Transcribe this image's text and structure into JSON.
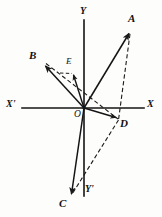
{
  "figure": {
    "type": "vector-diagram",
    "background_color": "#fdfdfc",
    "stroke_color": "#1a1a1a",
    "width": 162,
    "height": 217,
    "axes": {
      "x_positive_label": "X",
      "x_negative_label": "X'",
      "y_positive_label": "Y",
      "y_negative_label": "Y'",
      "origin_label": "O",
      "origin": {
        "x": 84,
        "y": 108
      },
      "x_axis": {
        "x1": 22,
        "y1": 108,
        "x2": 144,
        "y2": 108
      },
      "y_axis": {
        "x1": 84,
        "y1": 20,
        "x2": 84,
        "y2": 196
      },
      "x_label_pos": {
        "x": 148,
        "y": 100
      },
      "x_prime_label_pos": {
        "x": 7,
        "y": 100
      },
      "y_label_pos": {
        "x": 80,
        "y": 8
      },
      "y_prime_label_pos": {
        "x": 85,
        "y": 185
      },
      "origin_label_pos": {
        "x": 74,
        "y": 110
      }
    },
    "points": [
      {
        "name": "A",
        "label": "A",
        "x": 130,
        "y": 32,
        "label_x": 129,
        "label_y": 14
      },
      {
        "name": "B",
        "label": "B",
        "x": 44,
        "y": 65,
        "label_x": 30,
        "label_y": 50
      },
      {
        "name": "C",
        "label": "C",
        "x": 71,
        "y": 196,
        "label_x": 60,
        "label_y": 199
      },
      {
        "name": "D",
        "label": "D",
        "x": 117,
        "y": 118,
        "label_x": 120,
        "label_y": 118
      },
      {
        "name": "E",
        "label": "E",
        "x": 73,
        "y": 74,
        "label_x": 66,
        "label_y": 57
      }
    ],
    "solid_vectors": [
      {
        "name": "vector-OA",
        "from": "O",
        "to": "A",
        "x1": 84,
        "y1": 108,
        "x2": 130,
        "y2": 32
      },
      {
        "name": "vector-OB",
        "from": "O",
        "to": "B",
        "x1": 84,
        "y1": 108,
        "x2": 44,
        "y2": 65
      },
      {
        "name": "vector-OC",
        "from": "O",
        "to": "C",
        "x1": 84,
        "y1": 108,
        "x2": 71,
        "y2": 196
      },
      {
        "name": "vector-OD",
        "from": "O",
        "to": "D",
        "x1": 84,
        "y1": 108,
        "x2": 117,
        "y2": 118
      },
      {
        "name": "vector-OE",
        "from": "O",
        "to": "E",
        "x1": 84,
        "y1": 108,
        "x2": 73,
        "y2": 74
      }
    ],
    "dashed_lines": [
      {
        "name": "dashed-BD",
        "from": "B",
        "to": "D",
        "x1": 46,
        "y1": 63,
        "x2": 118,
        "y2": 119
      },
      {
        "name": "dashed-AD",
        "from": "A",
        "to": "D",
        "x1": 130,
        "y1": 34,
        "x2": 118,
        "y2": 120
      },
      {
        "name": "dashed-DC",
        "from": "D",
        "to": "C",
        "x1": 118,
        "y1": 120,
        "x2": 71,
        "y2": 195
      }
    ],
    "cropped_fragment": "g"
  }
}
